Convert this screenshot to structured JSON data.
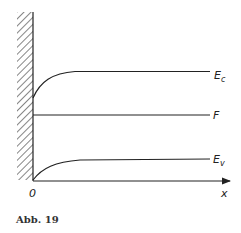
{
  "figure": {
    "caption": "Abb. 19",
    "origin_label": "0",
    "x_axis_label": "x",
    "curves": [
      {
        "name": "conduction-band-edge",
        "label": "Ec",
        "label_main": "E",
        "label_sub": "c"
      },
      {
        "name": "fermi-level",
        "label": "F",
        "label_main": "F",
        "label_sub": ""
      },
      {
        "name": "valence-band-edge",
        "label": "Ev",
        "label_main": "E",
        "label_sub": "v"
      }
    ],
    "colors": {
      "line": "#222222",
      "background": "#ffffff"
    }
  }
}
